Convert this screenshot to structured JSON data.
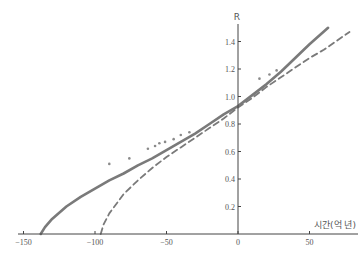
{
  "chart_data": {
    "type": "line",
    "title": "",
    "xlabel": "시간(억 년)",
    "ylabel": "R",
    "xlim": [
      -150,
      78
    ],
    "ylim": [
      0,
      1.55
    ],
    "x_ticks": [
      -150,
      -100,
      -50,
      0,
      50
    ],
    "x_tick_labels": [
      "−150",
      "−100",
      "−50",
      "0",
      "50"
    ],
    "y_ticks": [
      0.2,
      0.4,
      0.6,
      0.8,
      1.0,
      1.2,
      1.4
    ],
    "y_tick_labels": [
      "0.2",
      "0.4",
      "0.6",
      "0.8",
      "1.0",
      "1.2",
      "1.4"
    ],
    "grid": false,
    "legend": null,
    "colors": {
      "line": "#7a7a7a",
      "axis": "#444444",
      "points": "#8a8a8a"
    },
    "series": [
      {
        "name": "solid-model",
        "style": "solid",
        "x": [
          -138,
          -135,
          -130,
          -120,
          -110,
          -100,
          -90,
          -80,
          -70,
          -60,
          -50,
          -40,
          -30,
          -20,
          -10,
          0,
          10,
          20,
          30,
          40,
          50,
          63
        ],
        "y": [
          0.0,
          0.05,
          0.11,
          0.2,
          0.27,
          0.33,
          0.39,
          0.44,
          0.5,
          0.55,
          0.61,
          0.67,
          0.73,
          0.8,
          0.87,
          0.93,
          1.01,
          1.09,
          1.18,
          1.28,
          1.38,
          1.5
        ]
      },
      {
        "name": "dashed-model",
        "style": "dashed",
        "x": [
          -96,
          -94,
          -90,
          -85,
          -80,
          -70,
          -60,
          -50,
          -40,
          -30,
          -20,
          -10,
          0,
          10,
          20,
          30,
          40,
          50,
          60,
          78
        ],
        "y": [
          0.0,
          0.07,
          0.15,
          0.22,
          0.29,
          0.39,
          0.48,
          0.56,
          0.63,
          0.7,
          0.77,
          0.84,
          0.92,
          0.99,
          1.07,
          1.14,
          1.21,
          1.28,
          1.34,
          1.47
        ]
      },
      {
        "name": "observations",
        "style": "points",
        "x": [
          -90,
          -76,
          -63,
          -58,
          -55,
          -51,
          -45,
          -40,
          -34,
          15,
          22,
          27
        ],
        "y": [
          0.51,
          0.55,
          0.62,
          0.64,
          0.66,
          0.67,
          0.69,
          0.72,
          0.74,
          1.13,
          1.16,
          1.19
        ]
      }
    ]
  }
}
